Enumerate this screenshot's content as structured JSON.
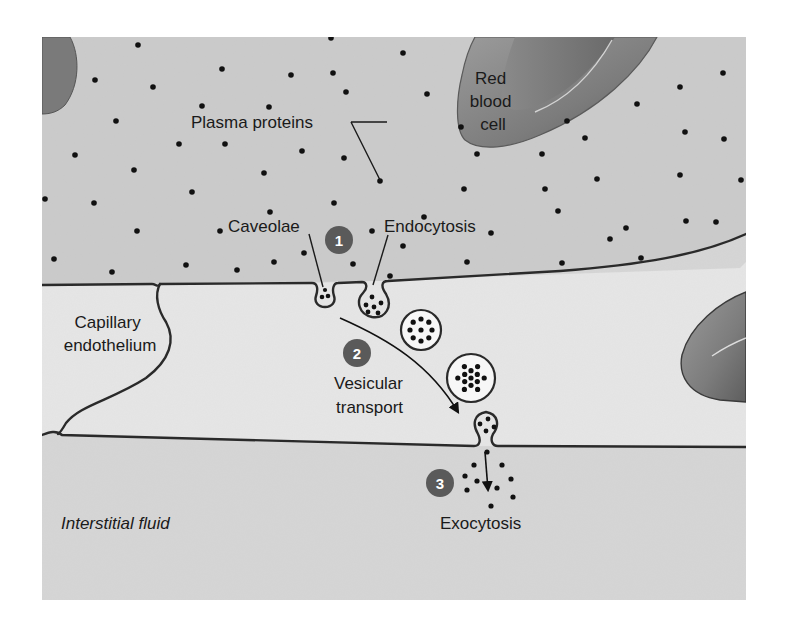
{
  "colors": {
    "plasma_bg": "#cbcbcb",
    "endothelium_bg": "#e6e6e6",
    "interstitial_bg": "#d6d6d6",
    "rbc_fill": "#8a8a8a",
    "rbc_dark": "#6d6d6d",
    "membrane": "#2a2a2a",
    "protein_dot": "#111111",
    "badge_fill": "#5a5a5a",
    "vesicle_fill": "#f7f7f7"
  },
  "labels": {
    "plasma_proteins": "Plasma proteins",
    "red_blood_cell": [
      "Red",
      "blood",
      "cell"
    ],
    "caveolae": "Caveolae",
    "endocytosis": "Endocytosis",
    "capillary_endothelium": [
      "Capillary",
      "endothelium"
    ],
    "vesicular_transport": [
      "Vesicular",
      "transport"
    ],
    "exocytosis": "Exocytosis",
    "interstitial_fluid": "Interstitial fluid"
  },
  "steps": [
    {
      "number": "1",
      "x": 339,
      "y": 240
    },
    {
      "number": "2",
      "x": 357,
      "y": 353
    },
    {
      "number": "3",
      "x": 440,
      "y": 483
    }
  ],
  "plasma_protein_dots": [
    [
      138,
      45
    ],
    [
      222,
      69
    ],
    [
      291,
      75
    ],
    [
      95,
      80
    ],
    [
      153,
      87
    ],
    [
      333,
      73
    ],
    [
      346,
      92
    ],
    [
      202,
      106
    ],
    [
      269,
      107
    ],
    [
      116,
      121
    ],
    [
      225,
      144
    ],
    [
      179,
      144
    ],
    [
      302,
      151
    ],
    [
      75,
      155
    ],
    [
      134,
      170
    ],
    [
      264,
      173
    ],
    [
      344,
      158
    ],
    [
      192,
      192
    ],
    [
      380,
      181
    ],
    [
      45,
      199
    ],
    [
      94,
      203
    ],
    [
      270,
      212
    ],
    [
      334,
      203
    ],
    [
      137,
      231
    ],
    [
      220,
      231
    ],
    [
      372,
      231
    ],
    [
      54,
      259
    ],
    [
      112,
      272
    ],
    [
      186,
      265
    ],
    [
      237,
      270
    ],
    [
      274,
      262
    ],
    [
      304,
      253
    ],
    [
      353,
      264
    ],
    [
      390,
      276
    ],
    [
      403,
      53
    ],
    [
      427,
      94
    ],
    [
      477,
      154
    ],
    [
      403,
      246
    ],
    [
      424,
      217
    ],
    [
      464,
      189
    ],
    [
      467,
      262
    ],
    [
      491,
      233
    ],
    [
      542,
      154
    ],
    [
      558,
      211
    ],
    [
      562,
      263
    ],
    [
      567,
      121
    ],
    [
      597,
      179
    ],
    [
      610,
      239
    ],
    [
      641,
      258
    ],
    [
      626,
      228
    ],
    [
      637,
      104
    ],
    [
      680,
      87
    ],
    [
      685,
      132
    ],
    [
      680,
      175
    ],
    [
      686,
      221
    ],
    [
      723,
      73
    ],
    [
      724,
      139
    ],
    [
      741,
      180
    ],
    [
      716,
      222
    ],
    [
      508,
      28
    ],
    [
      461,
      127
    ],
    [
      545,
      189
    ],
    [
      585,
      138
    ],
    [
      331,
      38
    ]
  ],
  "exocytosis_dots": [
    [
      487,
      452
    ],
    [
      474,
      465
    ],
    [
      502,
      465
    ],
    [
      465,
      476
    ],
    [
      477,
      481
    ],
    [
      511,
      479
    ],
    [
      497,
      488
    ],
    [
      513,
      497
    ],
    [
      467,
      490
    ],
    [
      491,
      506
    ]
  ],
  "vesicles": [
    {
      "cx": 421,
      "cy": 330,
      "r": 20
    },
    {
      "cx": 471,
      "cy": 378,
      "r": 24
    }
  ]
}
